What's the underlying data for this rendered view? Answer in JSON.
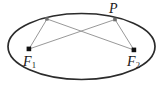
{
  "figure": {
    "kind": "ellipse-foci-diagram",
    "background_color": "#ffffff",
    "ellipse_stroke_color": "#2b2b2b",
    "chord_stroke_color": "#8c8c8c",
    "point_color": "#111111",
    "labels": {
      "point_p": "P",
      "focus_1": "F",
      "focus_1_sub": "1",
      "focus_2": "F",
      "focus_2_sub": "2"
    },
    "geometry": {
      "ellipse_center_x": 81.5,
      "ellipse_center_y": 46.5,
      "ellipse_radius_x": 73.5,
      "ellipse_radius_y": 33,
      "focus_1_x": 29,
      "focus_1_y": 49,
      "focus_2_x": 134,
      "focus_2_y": 50,
      "point_p_x": 115,
      "point_p_y": 19.5,
      "point_q_x": 47,
      "point_q_y": 19
    },
    "segments": [
      {
        "name": "q-to-f1",
        "x1": 47,
        "y1": 19,
        "x2": 29,
        "y2": 49
      },
      {
        "name": "q-to-f2",
        "x1": 47,
        "y1": 19,
        "x2": 134,
        "y2": 50
      },
      {
        "name": "p-to-f1",
        "x1": 115,
        "y1": 19.5,
        "x2": 29,
        "y2": 49
      },
      {
        "name": "p-to-f2",
        "x1": 115,
        "y1": 19.5,
        "x2": 134,
        "y2": 50
      }
    ]
  }
}
